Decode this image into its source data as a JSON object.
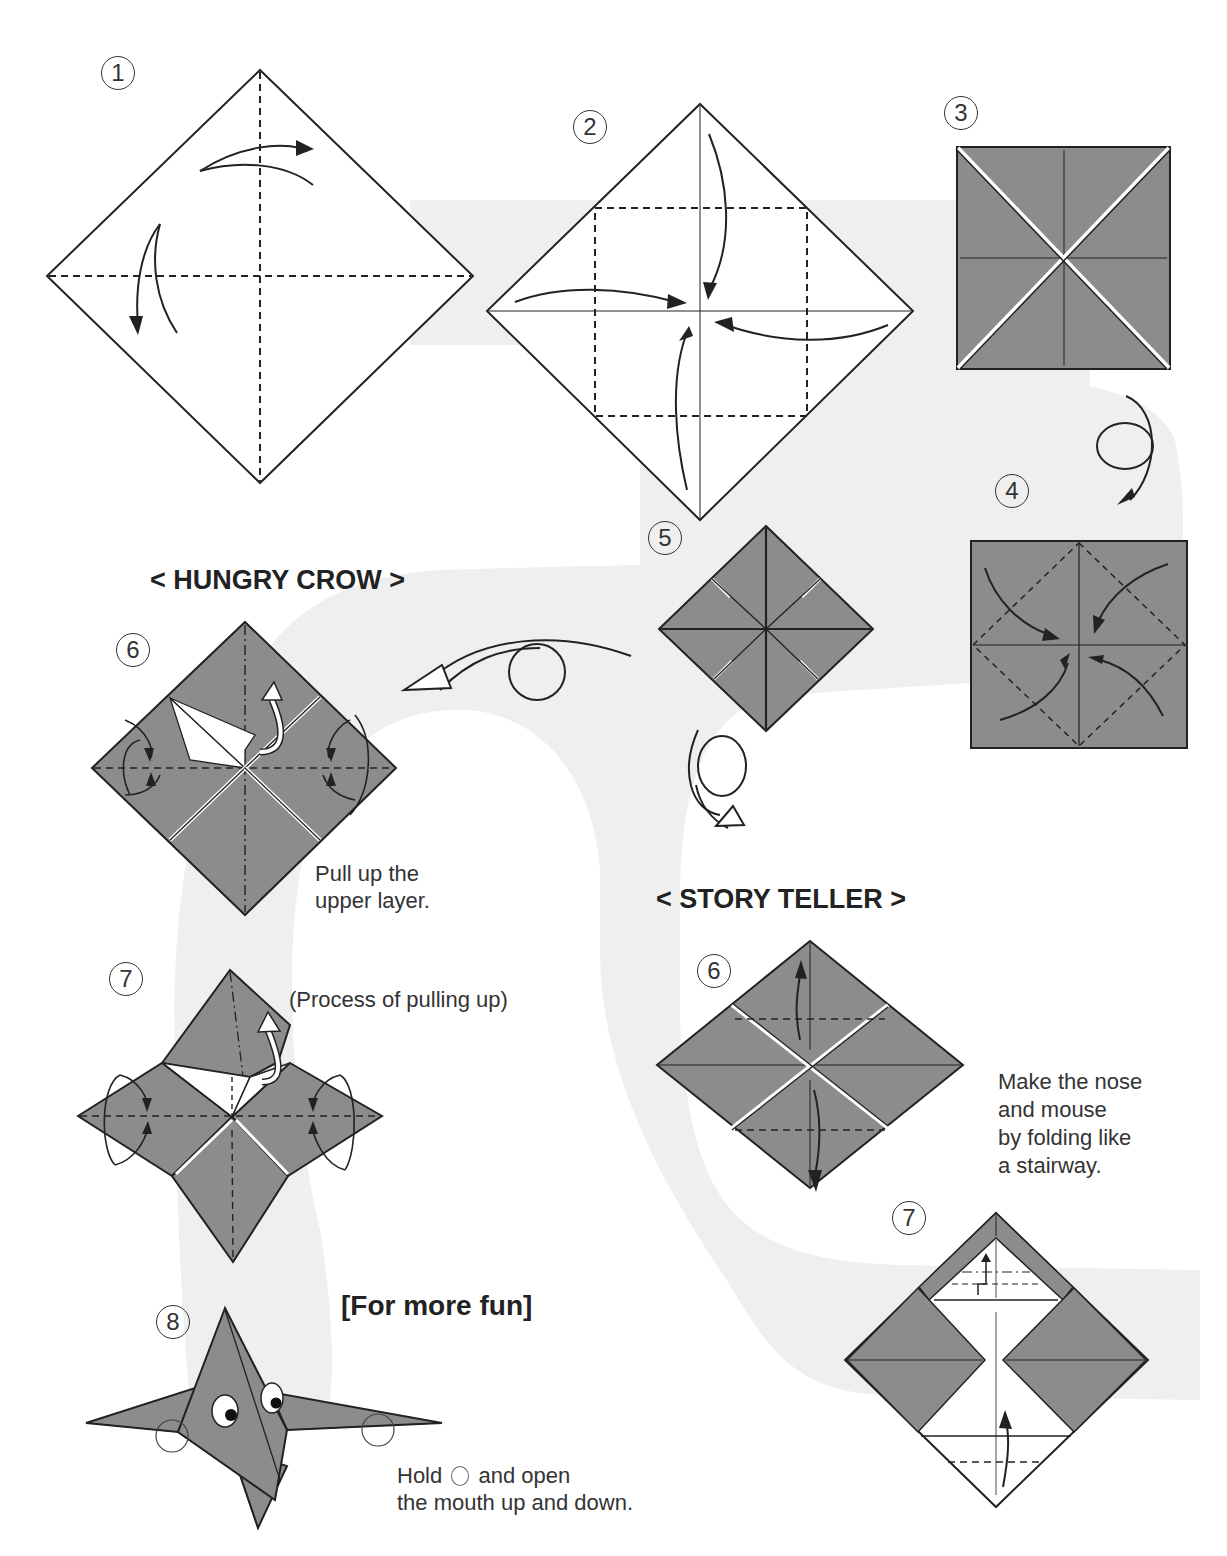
{
  "colors": {
    "paper_grey": "#8c8c8c",
    "background_band": "#efefef",
    "line": "#222222",
    "page": "#ffffff"
  },
  "steps": [
    {
      "id": "step-1",
      "label": "1"
    },
    {
      "id": "step-2",
      "label": "2"
    },
    {
      "id": "step-3",
      "label": "3"
    },
    {
      "id": "step-4",
      "label": "4"
    },
    {
      "id": "step-5",
      "label": "5"
    },
    {
      "id": "crow-step-6",
      "label": "6"
    },
    {
      "id": "crow-step-7",
      "label": "7"
    },
    {
      "id": "crow-step-8",
      "label": "8"
    },
    {
      "id": "teller-step-6",
      "label": "6"
    },
    {
      "id": "teller-step-7",
      "label": "7"
    }
  ],
  "headings": {
    "hungry_crow": "< HUNGRY CROW >",
    "story_teller": "< STORY TELLER >",
    "for_more_fun": "[For more fun]"
  },
  "notes": {
    "crow_step6": [
      "Pull up the",
      "upper layer."
    ],
    "crow_step7": "(Process of pulling up)",
    "crow_step8_line1_before": "Hold",
    "crow_step8_line1_after": "and open",
    "crow_step8_line2": "the mouth up and down.",
    "teller_step6": [
      "Make the nose",
      "and mouse",
      "by folding like",
      "a stairway."
    ]
  },
  "icons": {
    "valley_fold_arrow": "valley-fold-arrow-icon",
    "turn_over": "turn-over-icon",
    "pull_up_arrow": "pull-up-arrow-icon",
    "hold_point": "hold-point-circle-icon"
  }
}
